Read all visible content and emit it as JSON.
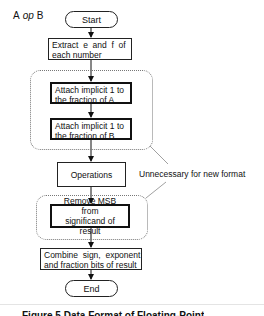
{
  "diagram": {
    "title_left": "A",
    "title_op": "op",
    "title_right": "B",
    "nodes": {
      "start": "Start",
      "extract": [
        "Extract  e  and  f  of",
        "each number"
      ],
      "attach_a": [
        "Attach implicit 1 to",
        "the fraction of A"
      ],
      "attach_b": [
        "Attach implicit 1 to",
        "the fraction of B"
      ],
      "operations": "Operations",
      "remove_msb": [
        "Remove MSB from",
        "significand of result"
      ],
      "combine": [
        "Combine  sign,  exponent",
        "and fraction bits of result"
      ],
      "end": "End"
    },
    "annotation": "Unnecessary for new format",
    "caption": "Figure 5  Data Format of Floating-Point"
  }
}
